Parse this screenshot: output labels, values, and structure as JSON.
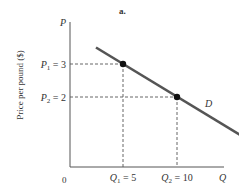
{
  "chart_data": {
    "type": "line",
    "title": "a.",
    "xlabel": "Q",
    "ylabel": "P",
    "y_axis_title": "Price per pound ($)",
    "origin_label": "0",
    "xlim": [
      0,
      14.3
    ],
    "ylim": [
      0,
      4.9
    ],
    "grid": false,
    "series": [
      {
        "name": "D",
        "points": [
          [
            0,
            3
          ],
          [
            5,
            3
          ],
          [
            10,
            2
          ]
        ],
        "line_start": [
          2.5,
          3.5
        ],
        "line_end": [
          15.8,
          0.86
        ],
        "color": "#555555"
      }
    ],
    "highlight_points": [
      {
        "name": "P1-Q1",
        "x": 5,
        "y": 3
      },
      {
        "name": "P2-Q2",
        "x": 10,
        "y": 2
      }
    ],
    "y_tick_labels": [
      {
        "sym": "P",
        "sub": "1",
        "value": 3,
        "text": " = 3"
      },
      {
        "sym": "P",
        "sub": "2",
        "value": 2,
        "text": " = 2"
      }
    ],
    "x_tick_labels": [
      {
        "sym": "Q",
        "sub": "1",
        "value": 5,
        "text": " = 5"
      },
      {
        "sym": "Q",
        "sub": "2",
        "value": 10,
        "text": " = 10"
      }
    ],
    "curve_label": "D"
  }
}
